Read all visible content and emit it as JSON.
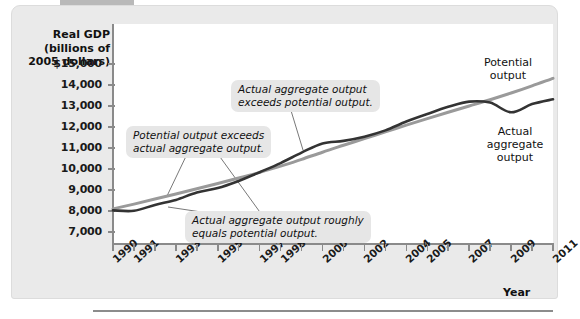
{
  "axes": {
    "y_title": "Real GDP\n(billions of\n2005 dollars)",
    "y_title_lines": [
      "Real GDP",
      "(billions of",
      "2005 dollars)"
    ],
    "x_title": "Year",
    "y_ticks": [
      "$15,000",
      "14,000",
      "13,000",
      "12,000",
      "11,000",
      "10,000",
      "9,000",
      "8,000",
      "7,000"
    ],
    "x_tick_labels": [
      "1990",
      "1991",
      "1993",
      "1995",
      "1997",
      "1998",
      "2000",
      "2002",
      "2004",
      "2005",
      "2007",
      "2009",
      "2011"
    ]
  },
  "annotations": {
    "potential_exceeds": "Potential output exceeds\nactual aggregate output.",
    "potential_exceeds_lines": [
      "Potential output exceeds",
      "actual aggregate output."
    ],
    "actual_exceeds": "Actual aggregate output\nexceeds potential output.",
    "actual_exceeds_lines": [
      "Actual aggregate output",
      "exceeds potential output."
    ],
    "roughly_equals": "Actual aggregate output roughly\nequals potential output.",
    "roughly_equals_lines": [
      "Actual aggregate output roughly",
      "equals potential output."
    ]
  },
  "series_labels": {
    "potential_lines": [
      "Potential",
      "output"
    ],
    "actual_lines": [
      "Actual",
      "aggregate",
      "output"
    ]
  },
  "colors": {
    "potential": "#9a9a9a",
    "actual": "#333333",
    "panel": "#eaeaea",
    "callout": "#e6e6e6",
    "axis": "#8a8a8a"
  },
  "chart_data": {
    "type": "line",
    "title": "",
    "xlabel": "Year",
    "ylabel": "Real GDP (billions of 2005 dollars)",
    "xlim": [
      1990,
      2011
    ],
    "ylim": [
      6800,
      15400
    ],
    "yticks": [
      7000,
      8000,
      9000,
      10000,
      11000,
      12000,
      13000,
      14000,
      15000
    ],
    "x": [
      1990,
      1991,
      1992,
      1993,
      1994,
      1995,
      1996,
      1997,
      1998,
      1999,
      2000,
      2001,
      2002,
      2003,
      2004,
      2005,
      2006,
      2007,
      2008,
      2009,
      2010,
      2011
    ],
    "grid": false,
    "legend": "inline-right",
    "series": [
      {
        "name": "Potential output",
        "color": "#9a9a9a",
        "values": [
          8100,
          8330,
          8570,
          8810,
          9060,
          9310,
          9570,
          9840,
          10140,
          10460,
          10800,
          11130,
          11450,
          11770,
          12090,
          12400,
          12700,
          13000,
          13300,
          13620,
          13960,
          14320
        ]
      },
      {
        "name": "Actual aggregate output",
        "color": "#333333",
        "values": [
          8030,
          8010,
          8290,
          8530,
          8880,
          9090,
          9430,
          9850,
          10280,
          10780,
          11220,
          11340,
          11540,
          11840,
          12260,
          12620,
          12960,
          13210,
          13160,
          12700,
          13090,
          13320
        ]
      }
    ],
    "annotations": [
      {
        "text": "Potential output exceeds actual aggregate output.",
        "points_to_year": 1993
      },
      {
        "text": "Actual aggregate output exceeds potential output.",
        "points_to_year": 2000
      },
      {
        "text": "Actual aggregate output roughly equals potential output.",
        "points_to_year": 1991
      }
    ]
  }
}
